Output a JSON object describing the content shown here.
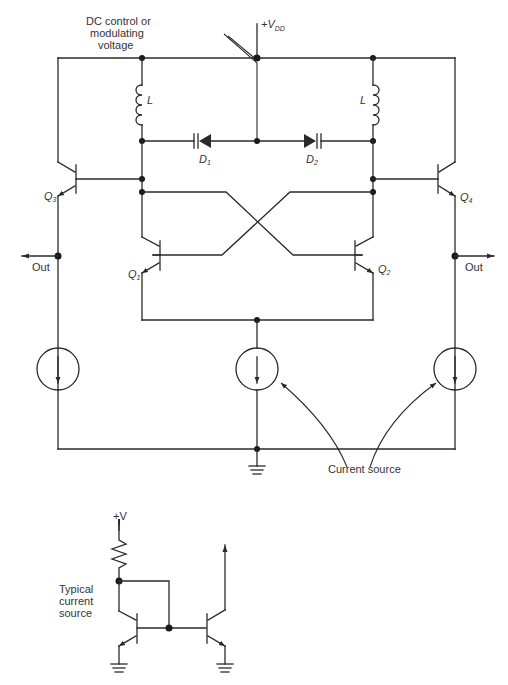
{
  "diagram": {
    "type": "circuit-schematic",
    "supply_label": "+V",
    "supply_sub": "DD",
    "control_label_lines": [
      "DC control or",
      "modulating",
      "voltage"
    ],
    "inductor_label": "L",
    "diodes": [
      {
        "name": "D",
        "sub": "1"
      },
      {
        "name": "D",
        "sub": "2"
      }
    ],
    "transistors": [
      {
        "name": "Q",
        "sub": "1"
      },
      {
        "name": "Q",
        "sub": "2"
      },
      {
        "name": "Q",
        "sub": "3"
      },
      {
        "name": "Q",
        "sub": "4"
      }
    ],
    "out_left": "Out",
    "out_right": "Out",
    "current_source_label": "Current source",
    "inset": {
      "supply_label": "+V",
      "caption_lines": [
        "Typical",
        "current",
        "source"
      ]
    }
  }
}
